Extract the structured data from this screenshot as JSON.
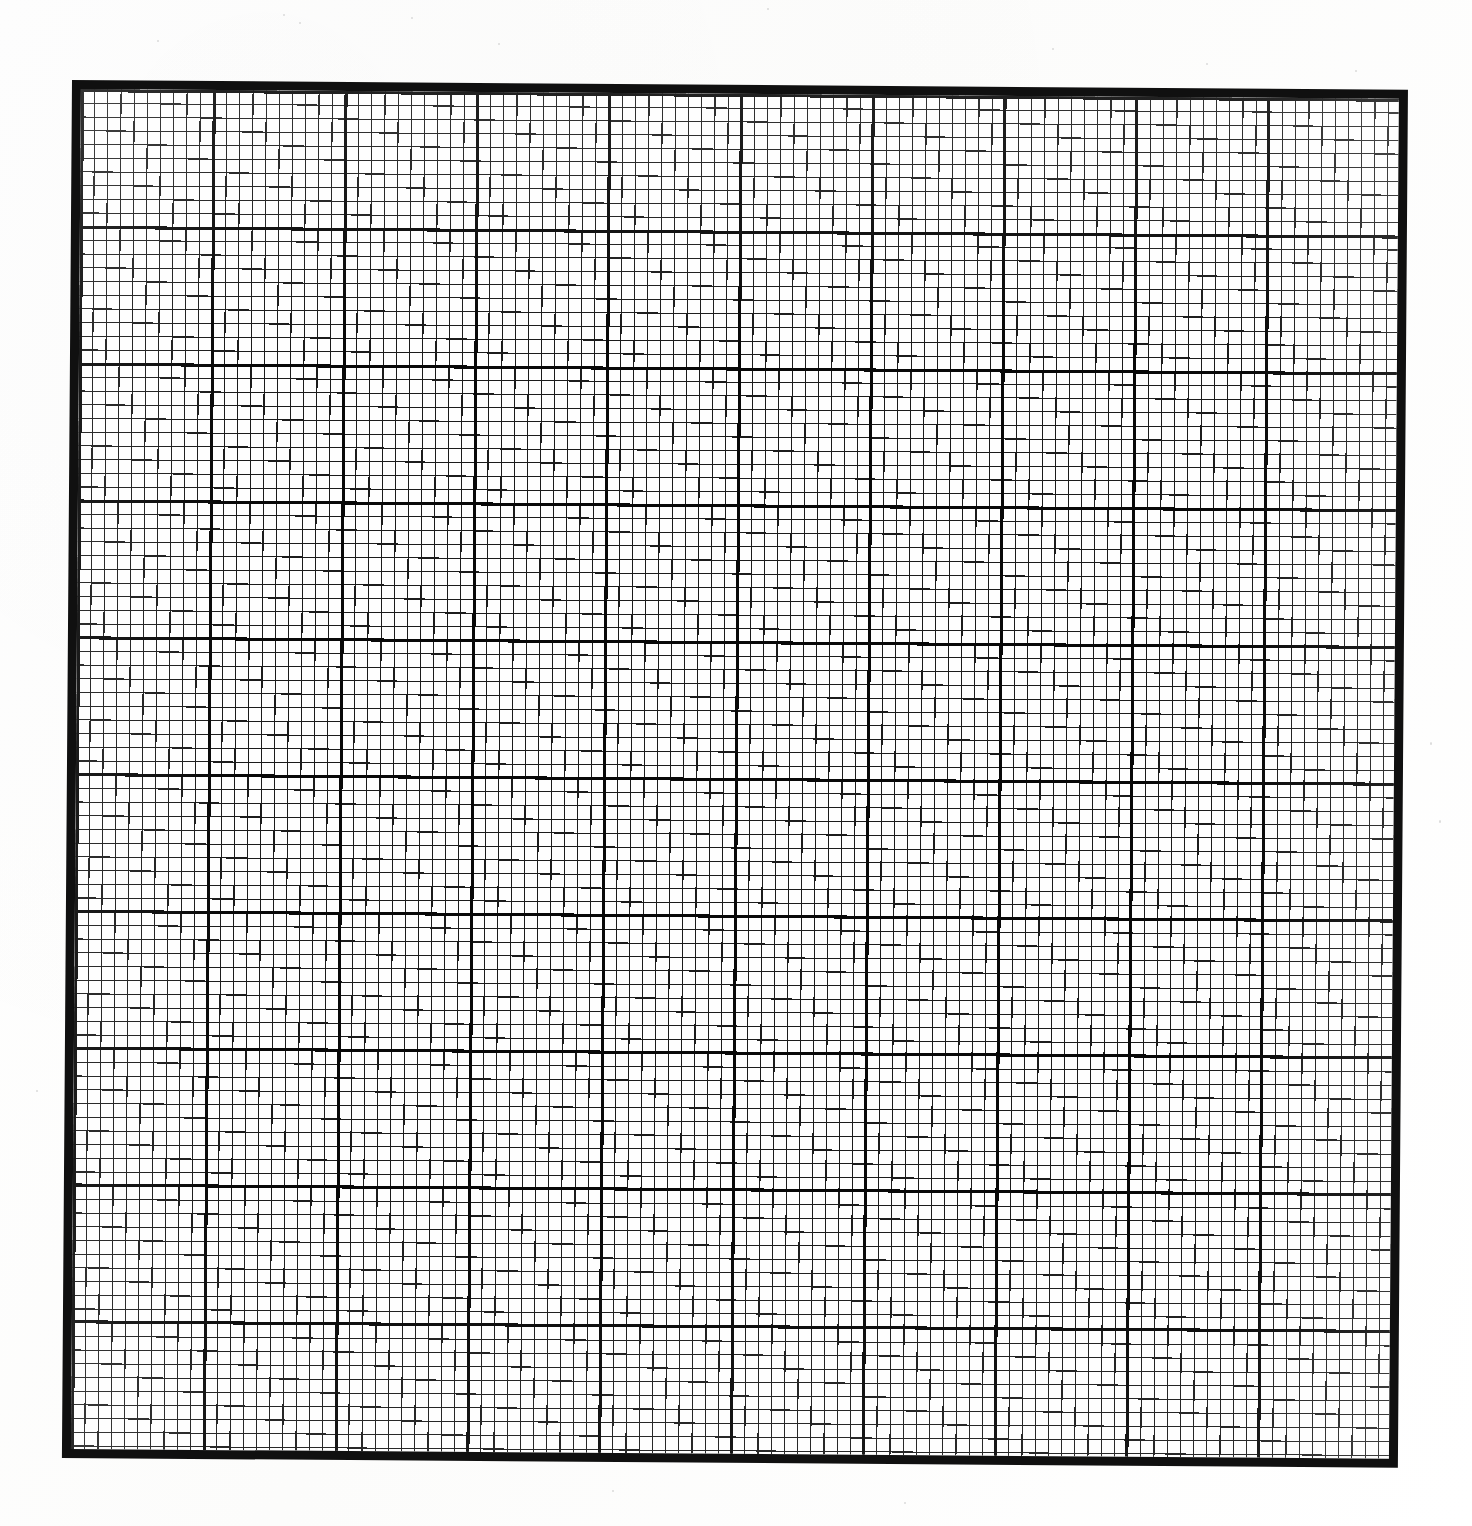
{
  "document": {
    "kind": "graph-paper-scan",
    "title": "Graph Paper Grid Sheet",
    "caption": "",
    "background_color": "#fdfdfd",
    "paper_color": "#fefefe",
    "ink_color": "#101010"
  },
  "chart_data": {
    "type": "table",
    "title": "",
    "subtitle": "",
    "xlabel": "",
    "ylabel": "",
    "grid": true,
    "legend_position": "none",
    "major_columns": 10,
    "major_rows": 10,
    "minor_per_major": 10,
    "minor_columns_total": 100,
    "minor_rows_total": 100,
    "categories": [
      "1",
      "2",
      "3",
      "4",
      "5",
      "6",
      "7",
      "8",
      "9",
      "10"
    ],
    "values": [
      0,
      0,
      0,
      0,
      0,
      0,
      0,
      0,
      0,
      0
    ],
    "xlim": [
      0,
      100
    ],
    "ylim": [
      0,
      100
    ],
    "tick_labels_x": [],
    "tick_labels_y": [],
    "annotations": []
  },
  "geometry": {
    "sheet_left_px": 72,
    "sheet_top_px": 80,
    "sheet_width_px": 1336,
    "sheet_height_px": 1378,
    "border_thickness_px": 9,
    "major_line_thickness_px": 3,
    "minor_line_thickness_px": 1,
    "major_cell_width_px": 131.8,
    "major_cell_height_px": 136.8,
    "minor_cell_width_px": 13.2,
    "minor_cell_height_px": 13.7,
    "rotation_deg": 0.42
  },
  "colors": {
    "border": "#101010",
    "major_line": "#080808",
    "minor_line": "#1b1b1b",
    "paper": "#fefefe",
    "page_background": "#fdfdfd"
  }
}
